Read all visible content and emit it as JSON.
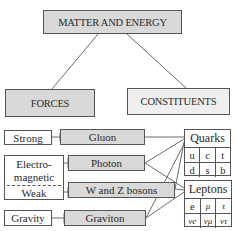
{
  "title": "MATTER AND ENERGY",
  "categories": {
    "forces": "FORCES",
    "constituents": "CONSTITUENTS"
  },
  "forces": [
    {
      "name": "Strong",
      "carrier": "Gluon"
    },
    {
      "name_line1": "Electro-",
      "name_line2": "magnetic",
      "carrier": "Photon"
    },
    {
      "name": "Weak",
      "carrier": "W and Z bosons"
    },
    {
      "name": "Gravity",
      "carrier": "Graviton"
    }
  ],
  "quarks": {
    "title": "Quarks",
    "rows": [
      [
        "u",
        "c",
        "t"
      ],
      [
        "d",
        "s",
        "b"
      ]
    ]
  },
  "leptons": {
    "title": "Leptons",
    "rows": [
      [
        "e",
        "μ",
        "τ"
      ],
      [
        "νe",
        "νμ",
        "ντ"
      ]
    ]
  },
  "connections": [
    {
      "from": "Gluon",
      "to": "Quarks"
    },
    {
      "from": "Photon",
      "to": "Quarks"
    },
    {
      "from": "Photon",
      "to": "Leptons"
    },
    {
      "from": "W and Z bosons",
      "to": "Quarks"
    },
    {
      "from": "W and Z bosons",
      "to": "Leptons"
    },
    {
      "from": "Graviton",
      "to": "Quarks"
    },
    {
      "from": "Graviton",
      "to": "Leptons"
    }
  ],
  "colors": {
    "box_fill": "#d9d9d9",
    "line": "#6b6b6b",
    "border": "#555555"
  }
}
